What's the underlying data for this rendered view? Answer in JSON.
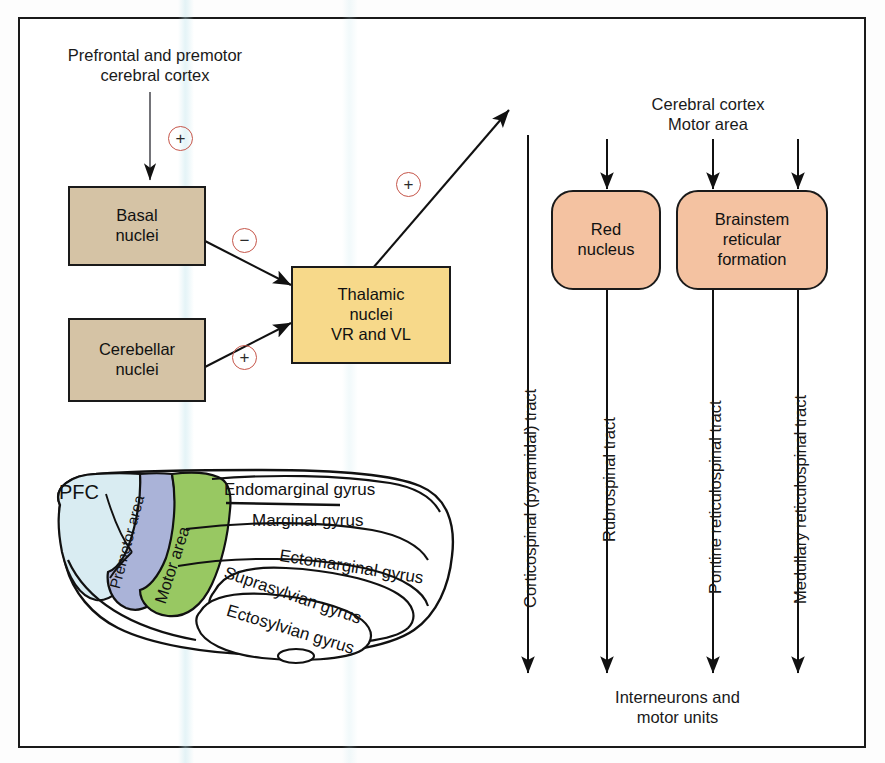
{
  "figure": {
    "title_top": "Prefrontal and premotor\ncerebral cortex",
    "cortex_label": "Cerebral cortex\nMotor area",
    "output_label": "Interneurons and\nmotor units"
  },
  "boxes": {
    "basal": "Basal\nnuclei",
    "cerebellar": "Cerebellar\nnuclei",
    "thalamic": "Thalamic\nnuclei\nVR and VL",
    "red_nucleus": "Red\nnucleus",
    "brainstem": "Brainstem\nreticular\nformation"
  },
  "signs": {
    "cortex_to_basal": "+",
    "basal_to_thalamic": "−",
    "cerebellar_to_thalamic": "+",
    "thalamic_out": "+"
  },
  "tracts": [
    {
      "name": "corticospinal",
      "label": "Corticospinal (pyramidal) tract"
    },
    {
      "name": "rubrospinal",
      "label": "Rubrospinal tract"
    },
    {
      "name": "pontine",
      "label": "Pontine reticulospinal tract"
    },
    {
      "name": "medullary",
      "label": "Medullary reticulospinal tract"
    }
  ],
  "brain": {
    "regions": [
      {
        "name": "pfc",
        "label": "PFC",
        "color": "#d9ecf2"
      },
      {
        "name": "premotor",
        "label": "Premotor area",
        "color": "#aab3d8"
      },
      {
        "name": "motor",
        "label": "Motor area",
        "color": "#98c862"
      }
    ],
    "gyri": [
      {
        "name": "endomarginal",
        "label": "Endomarginal gyrus"
      },
      {
        "name": "marginal",
        "label": "Marginal gyrus"
      },
      {
        "name": "ectomarginal",
        "label": "Ectomarginal gyrus"
      },
      {
        "name": "suprasylvian",
        "label": "Suprasylvian gyrus"
      },
      {
        "name": "ectosylvian",
        "label": "Ectosylvian gyrus"
      }
    ]
  },
  "colors": {
    "tan_box": "#d5c3a5",
    "yellow_box": "#f7d98a",
    "salmon_box": "#f4c2a1",
    "sign_ring": "#c6564a",
    "stroke": "#1a1a1a"
  }
}
